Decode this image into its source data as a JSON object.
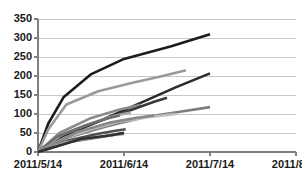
{
  "chart_data": {
    "type": "line",
    "title": "",
    "subtitle": "",
    "xlabel": "",
    "ylabel": "",
    "grid": true,
    "legend": false,
    "legend_position": "none",
    "ylim": [
      0,
      350
    ],
    "yticks": [
      0,
      50,
      100,
      150,
      200,
      250,
      300,
      350
    ],
    "ytick_labels": [
      "0",
      "50",
      "100",
      "150",
      "200",
      "250",
      "300",
      "350"
    ],
    "x": [
      "2011/5/14",
      "2011/6/14",
      "2011/7/14",
      "2011/8/14"
    ],
    "xtick_labels": [
      "2011/5/14",
      "2011/6/14",
      "2011/7/14",
      "2011/8/14"
    ],
    "xlim_labels": [
      "2011/5/14",
      "2011/8/14"
    ],
    "series": [
      {
        "name": "series-1",
        "color": "#1c1c1c",
        "width": 2.6,
        "points": [
          [
            0,
            0
          ],
          [
            0.12,
            75
          ],
          [
            0.3,
            145
          ],
          [
            0.62,
            205
          ],
          [
            1.0,
            245
          ],
          [
            1.55,
            278
          ],
          [
            2.0,
            310
          ]
        ]
      },
      {
        "name": "series-2",
        "color": "#9a9a9a",
        "width": 2.6,
        "points": [
          [
            0,
            0
          ],
          [
            0.12,
            60
          ],
          [
            0.33,
            125
          ],
          [
            0.7,
            160
          ],
          [
            1.1,
            182
          ],
          [
            1.45,
            200
          ],
          [
            1.72,
            215
          ]
        ]
      },
      {
        "name": "series-3",
        "color": "#2b2b2b",
        "width": 2.6,
        "points": [
          [
            0,
            0
          ],
          [
            0.3,
            42
          ],
          [
            0.75,
            85
          ],
          [
            1.2,
            130
          ],
          [
            1.6,
            170
          ],
          [
            2.0,
            207
          ]
        ]
      },
      {
        "name": "series-4",
        "color": "#7d7d7d",
        "width": 2.6,
        "points": [
          [
            0,
            0
          ],
          [
            0.35,
            38
          ],
          [
            0.8,
            68
          ],
          [
            1.25,
            92
          ],
          [
            1.65,
            106
          ],
          [
            2.0,
            118
          ]
        ]
      },
      {
        "name": "series-5",
        "color": "#8c8c8c",
        "width": 2.6,
        "points": [
          [
            0,
            0
          ],
          [
            0.25,
            50
          ],
          [
            0.6,
            88
          ],
          [
            0.95,
            112
          ],
          [
            1.2,
            124
          ]
        ]
      },
      {
        "name": "series-6",
        "color": "#3a3a3a",
        "width": 2.6,
        "points": [
          [
            0,
            0
          ],
          [
            0.3,
            45
          ],
          [
            0.7,
            80
          ],
          [
            1.05,
            108
          ],
          [
            1.35,
            132
          ],
          [
            1.5,
            143
          ]
        ]
      },
      {
        "name": "series-7",
        "color": "#a5a5a5",
        "width": 2.6,
        "points": [
          [
            0,
            0
          ],
          [
            0.28,
            46
          ],
          [
            0.62,
            76
          ],
          [
            0.9,
            96
          ],
          [
            1.08,
            104
          ]
        ]
      },
      {
        "name": "series-8",
        "color": "#6e6e6e",
        "width": 2.6,
        "points": [
          [
            0,
            0
          ],
          [
            0.22,
            40
          ],
          [
            0.55,
            70
          ],
          [
            0.8,
            88
          ],
          [
            0.95,
            96
          ]
        ]
      },
      {
        "name": "series-9",
        "color": "#bdbdbd",
        "width": 2.6,
        "points": [
          [
            0,
            0
          ],
          [
            0.3,
            36
          ],
          [
            0.65,
            62
          ],
          [
            0.95,
            80
          ],
          [
            1.3,
            92
          ],
          [
            1.6,
            100
          ]
        ]
      },
      {
        "name": "series-10",
        "color": "#4f4f4f",
        "width": 2.6,
        "points": [
          [
            0,
            0
          ],
          [
            0.35,
            30
          ],
          [
            0.7,
            48
          ],
          [
            0.9,
            56
          ],
          [
            1.02,
            60
          ]
        ]
      },
      {
        "name": "series-11",
        "color": "#585858",
        "width": 2.6,
        "points": [
          [
            0,
            0
          ],
          [
            0.4,
            28
          ],
          [
            0.75,
            40
          ],
          [
            0.92,
            47
          ],
          [
            1.0,
            50
          ]
        ]
      },
      {
        "name": "series-12",
        "color": "#b0b0b0",
        "width": 2.6,
        "points": [
          [
            0,
            0
          ],
          [
            0.3,
            24
          ],
          [
            0.6,
            36
          ],
          [
            0.85,
            44
          ],
          [
            1.0,
            47
          ]
        ]
      },
      {
        "name": "series-13",
        "color": "#888888",
        "width": 2.6,
        "points": [
          [
            0,
            0
          ],
          [
            0.45,
            52
          ],
          [
            0.85,
            78
          ],
          [
            1.15,
            90
          ],
          [
            1.35,
            96
          ]
        ]
      },
      {
        "name": "series-14",
        "color": "#2f2f2f",
        "width": 2.6,
        "points": [
          [
            0,
            0
          ],
          [
            0.5,
            34
          ],
          [
            0.85,
            44
          ],
          [
            1.0,
            50
          ]
        ]
      }
    ]
  },
  "axis": {
    "axis_color": "#808080",
    "grid_color": "#c8c8c8",
    "label_color": "#1a1a1a"
  }
}
